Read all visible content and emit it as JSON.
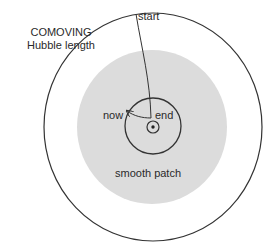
{
  "diagram": {
    "labels": {
      "comoving_line1": "COMOVING",
      "comoving_line2": "Hubble length",
      "start": "start",
      "now": "now",
      "end": "end",
      "smooth_patch": "smooth patch"
    },
    "colors": {
      "background": "#ffffff",
      "stroke": "#333333",
      "patch_fill": "#dcdcdc"
    },
    "shapes": {
      "hubble_circle": {
        "cx": 153,
        "cy": 127,
        "rx": 109,
        "ry": 114
      },
      "smooth_patch": {
        "cx": 152,
        "cy": 127,
        "rx": 75,
        "ry": 77
      },
      "present_horizon_circle": {
        "cx": 153,
        "cy": 127,
        "r": 28
      },
      "observer_ring": {
        "cx": 153,
        "cy": 127,
        "r": 6
      },
      "observer_dot": {
        "cx": 153,
        "cy": 127,
        "r": 1.6
      }
    }
  }
}
